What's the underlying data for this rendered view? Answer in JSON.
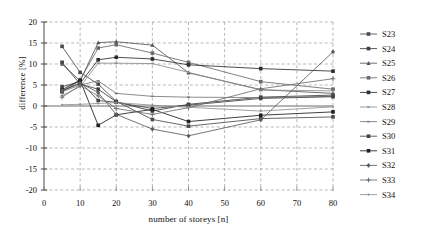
{
  "chart_data": {
    "type": "line",
    "title": "",
    "xlabel": "number of storeys [n]",
    "ylabel": "difference [%]",
    "xlim": [
      0,
      80
    ],
    "ylim": [
      -20,
      20
    ],
    "xticks": [
      0,
      10,
      20,
      30,
      40,
      50,
      60,
      70,
      80
    ],
    "xtick_labels": [
      "0",
      "10",
      "20",
      "30",
      "40",
      "50",
      "60",
      "70",
      "80"
    ],
    "yticks": [
      -20,
      -15,
      -10,
      -5,
      0,
      5,
      10,
      15,
      20
    ],
    "ytick_labels": [
      "-20",
      "-15",
      "-10",
      "-5",
      "0",
      "5",
      "10",
      "15",
      "20"
    ],
    "grid": "dashed-both",
    "legend_position": "right",
    "x": [
      5,
      10,
      15,
      20,
      30,
      40,
      60,
      80
    ],
    "series": [
      {
        "name": "S23",
        "marker": "square",
        "color": "#4a4a4a",
        "values": [
          14.2,
          8.0,
          5.2,
          1.1,
          -3.2,
          -4.8,
          -3.0,
          -2.6
        ]
      },
      {
        "name": "S24",
        "marker": "square",
        "color": "#3c3c3c",
        "values": [
          10.4,
          5.2,
          4.0,
          1.0,
          -1.2,
          0.4,
          2.1,
          2.6
        ]
      },
      {
        "name": "S25",
        "marker": "triangle",
        "color": "#555555",
        "values": [
          10.0,
          6.0,
          15.1,
          15.3,
          14.5,
          7.9,
          3.9,
          3.0
        ]
      },
      {
        "name": "S26",
        "marker": "square",
        "color": "#6a6a6a",
        "values": [
          3.3,
          6.2,
          13.8,
          14.6,
          12.6,
          10.4,
          5.8,
          4.0
        ]
      },
      {
        "name": "S27",
        "marker": "square",
        "color": "#2d2d2d",
        "values": [
          3.6,
          5.4,
          11.0,
          11.6,
          11.2,
          9.8,
          8.9,
          8.3
        ]
      },
      {
        "name": "S28",
        "marker": "line",
        "color": "#8d8d8d",
        "values": [
          2.5,
          4.6,
          10.2,
          10.2,
          10.1,
          8.0,
          3.8,
          3.6
        ]
      },
      {
        "name": "S29",
        "marker": "line",
        "color": "#777777",
        "values": [
          3.4,
          5.0,
          6.0,
          3.0,
          2.3,
          2.1,
          2.0,
          2.3
        ]
      },
      {
        "name": "S30",
        "marker": "square",
        "color": "#444444",
        "values": [
          4.6,
          5.8,
          1.3,
          0.9,
          -0.6,
          0.2,
          1.8,
          2.2
        ]
      },
      {
        "name": "S31",
        "marker": "square",
        "color": "#1f1f1f",
        "values": [
          3.9,
          6.1,
          -4.6,
          -2.1,
          -0.8,
          -3.7,
          -2.2,
          -1.4
        ]
      },
      {
        "name": "S32",
        "marker": "diamond",
        "color": "#5c5c5c",
        "values": [
          3.7,
          5.5,
          3.2,
          -2.0,
          -5.5,
          -7.1,
          -3.3,
          12.9
        ]
      },
      {
        "name": "S33",
        "marker": "plus",
        "color": "#6e6e6e",
        "values": [
          2.1,
          4.9,
          2.4,
          -0.6,
          -2.0,
          -0.4,
          4.1,
          6.5
        ]
      },
      {
        "name": "S34",
        "marker": "dot",
        "color": "#909090",
        "values": [
          0.3,
          0.4,
          0.6,
          0.8,
          0.2,
          -0.3,
          -1.2,
          -0.2
        ]
      }
    ]
  },
  "legend": {
    "entries": [
      "S23",
      "S24",
      "S25",
      "S26",
      "S27",
      "S28",
      "S29",
      "S30",
      "S31",
      "S32",
      "S33",
      "S34"
    ]
  }
}
